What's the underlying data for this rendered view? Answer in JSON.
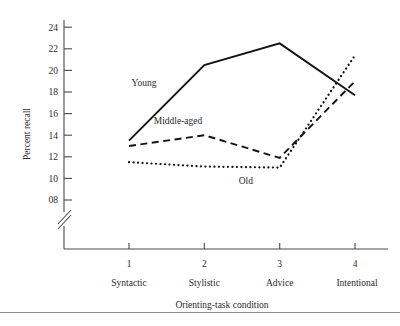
{
  "chart_data": {
    "type": "line",
    "title": "",
    "xlabel": "Orienting-task condition",
    "ylabel": "Percent recall",
    "categories": [
      "1",
      "2",
      "3",
      "4"
    ],
    "category_names": [
      "Syntactic",
      "Stylistic",
      "Advice",
      "Intentional"
    ],
    "x": [
      1,
      2,
      3,
      4
    ],
    "ylim": [
      7,
      25
    ],
    "yticks": [
      "08",
      "10",
      "12",
      "14",
      "16",
      "18",
      "20",
      "22",
      "24"
    ],
    "ytick_values": [
      8,
      10,
      12,
      14,
      16,
      18,
      20,
      22,
      24
    ],
    "axis_break": true,
    "grid": false,
    "legend_position": "inline-labels",
    "series": [
      {
        "name": "Young",
        "style": "solid",
        "color": "#141414",
        "values": [
          13.5,
          20.5,
          22.5,
          17.7
        ],
        "label_x": 1.2,
        "label_y": 18.6
      },
      {
        "name": "Middle-aged",
        "style": "dashed",
        "color": "#141414",
        "values": [
          13.0,
          14.0,
          11.9,
          19.0
        ],
        "label_x": 1.65,
        "label_y": 15.0
      },
      {
        "name": "Old",
        "style": "dotted",
        "color": "#141414",
        "values": [
          11.5,
          11.1,
          11.0,
          21.4
        ],
        "label_x": 2.55,
        "label_y": 9.5
      }
    ]
  },
  "axes": {
    "y_axis_label": "Percent recall",
    "x_axis_label": "Orienting-task condition"
  }
}
